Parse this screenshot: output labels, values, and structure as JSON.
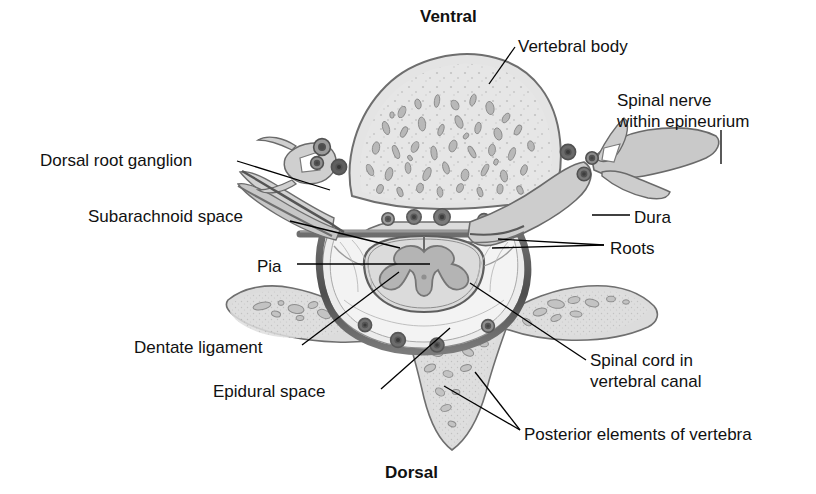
{
  "figure": {
    "orientation": {
      "top_label": "Ventral",
      "bottom_label": "Dorsal"
    },
    "colors": {
      "background": "#ffffff",
      "bone_fill": "#e2e2e2",
      "bone_stroke": "#6b6b6b",
      "trabecula_fill": "#bcbcbc",
      "trabecula_stroke": "#8a8a8a",
      "dura_dark": "#575757",
      "dura_mid": "#8f8f8f",
      "cord_fill": "#d6d6d6",
      "gray_matter": "#b2b2b2",
      "vessel_fill": "#7a7a7a",
      "vessel_dark": "#4a4a4a",
      "soft_tissue": "#d9d9d9",
      "leader_line": "#000000",
      "text": "#111111"
    },
    "labels": [
      {
        "id": "ventral",
        "text": "Ventral",
        "bold": true,
        "x": 420,
        "y": 6,
        "align": "left"
      },
      {
        "id": "vertebral-body",
        "text": "Vertebral body",
        "bold": false,
        "x": 518,
        "y": 36,
        "align": "left"
      },
      {
        "id": "spinal-nerve",
        "text": "Spinal nerve\nwithin epineurium",
        "bold": false,
        "x": 617,
        "y": 90,
        "align": "left"
      },
      {
        "id": "drg",
        "text": "Dorsal root ganglion",
        "bold": false,
        "x": 40,
        "y": 150,
        "align": "left"
      },
      {
        "id": "subarachnoid",
        "text": "Subarachnoid space",
        "bold": false,
        "x": 88,
        "y": 206,
        "align": "left"
      },
      {
        "id": "dura",
        "text": "Dura",
        "bold": false,
        "x": 634,
        "y": 207,
        "align": "left"
      },
      {
        "id": "roots",
        "text": "Roots",
        "bold": false,
        "x": 610,
        "y": 238,
        "align": "left"
      },
      {
        "id": "pia",
        "text": "Pia",
        "bold": false,
        "x": 257,
        "y": 256,
        "align": "left"
      },
      {
        "id": "dentate",
        "text": "Dentate ligament",
        "bold": false,
        "x": 134,
        "y": 337,
        "align": "left"
      },
      {
        "id": "spinal-cord",
        "text": "Spinal cord in\nvertebral canal",
        "bold": false,
        "x": 590,
        "y": 350,
        "align": "left"
      },
      {
        "id": "epidural",
        "text": "Epidural space",
        "bold": false,
        "x": 213,
        "y": 381,
        "align": "left"
      },
      {
        "id": "posterior",
        "text": "Posterior elements of vertebra",
        "bold": false,
        "x": 524,
        "y": 424,
        "align": "left"
      },
      {
        "id": "dorsal",
        "text": "Dorsal",
        "bold": true,
        "x": 385,
        "y": 462,
        "align": "left"
      }
    ],
    "leaders": [
      {
        "id": "leader-vertebral-body",
        "points": "515,47 489,84"
      },
      {
        "id": "leader-spinal-nerve",
        "points": "721,130 721,164"
      },
      {
        "id": "leader-drg",
        "points": "237,161 330,190"
      },
      {
        "id": "leader-subarachnoid",
        "points": "290,221 400,248"
      },
      {
        "id": "leader-dura",
        "points": "630,215 592,215"
      },
      {
        "id": "leader-roots",
        "points": "604,245 492,248"
      },
      {
        "id": "leader-roots2",
        "points": "604,245 498,239"
      },
      {
        "id": "leader-pia",
        "points": "297,264 430,264"
      },
      {
        "id": "leader-dentate",
        "points": "302,345 399,272"
      },
      {
        "id": "leader-spinal-cord",
        "points": "586,360 470,283"
      },
      {
        "id": "leader-epidural",
        "points": "381,389 450,328"
      },
      {
        "id": "leader-posterior-a",
        "points": "520,430 444,386"
      },
      {
        "id": "leader-posterior-b",
        "points": "520,430 475,372"
      }
    ],
    "structures": [
      {
        "name": "vertebral-body",
        "description": "large ovoid cancellous bone at top"
      },
      {
        "name": "spinal-cord",
        "description": "round cord with butterfly gray matter"
      },
      {
        "name": "dura-mater",
        "description": "dark thick membrane ring around cord"
      },
      {
        "name": "subarachnoid-space",
        "description": "clear space between arachnoid and pia"
      },
      {
        "name": "dorsal-root-ganglion",
        "description": "swelling on left nerve root"
      },
      {
        "name": "spinal-nerve",
        "description": "right-hand branching nerve in epineurium"
      },
      {
        "name": "transverse-process-left",
        "description": "left lateral bony wing"
      },
      {
        "name": "transverse-process-right",
        "description": "right lateral bony wing"
      },
      {
        "name": "spinous-process",
        "description": "inferior midline bony projection"
      },
      {
        "name": "epidural-space",
        "description": "fat filled space inside vertebral canal"
      },
      {
        "name": "vessels",
        "description": "small dark circular vessels"
      }
    ]
  }
}
